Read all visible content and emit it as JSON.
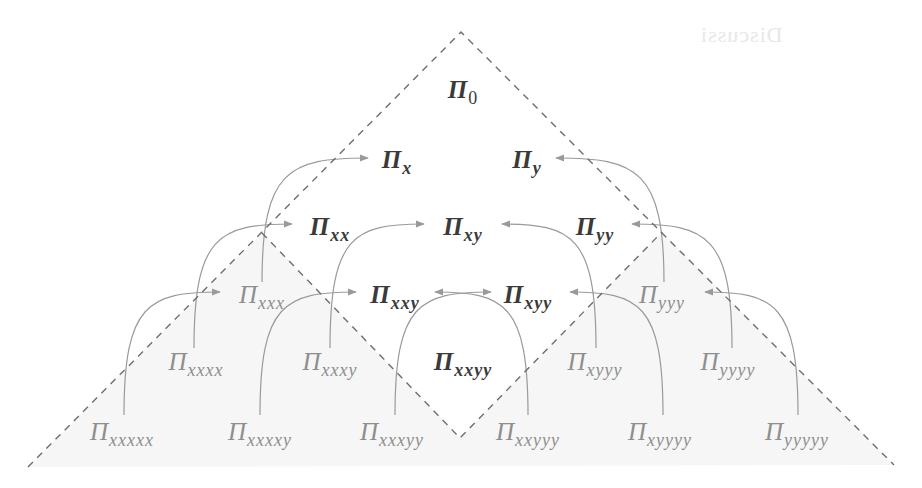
{
  "figure": {
    "ghost_text": "Discussi",
    "colors": {
      "dashed_line": "#6e6e6e",
      "arrow": "#9a9a9a",
      "dark_label": "#3a3a3a",
      "light_label": "#8e8e8e",
      "shade": "#f6f6f6"
    },
    "outer_triangle": {
      "apex": [
        461,
        32
      ],
      "left": [
        28,
        467
      ],
      "right": [
        894,
        465
      ]
    },
    "inner_diamond": {
      "top": [
        461,
        32
      ],
      "left": [
        262,
        233
      ],
      "bottom": [
        460,
        438
      ],
      "right": [
        662,
        232
      ]
    },
    "nodes": [
      {
        "id": "0",
        "symbol": "Π",
        "sub": "0",
        "x": 463,
        "y": 98,
        "style": "dark"
      },
      {
        "id": "x",
        "symbol": "Π",
        "sub": "x",
        "x": 397,
        "y": 168,
        "style": "dark"
      },
      {
        "id": "y",
        "symbol": "Π",
        "sub": "y",
        "x": 527,
        "y": 168,
        "style": "dark"
      },
      {
        "id": "xx",
        "symbol": "Π",
        "sub": "xx",
        "x": 330,
        "y": 235,
        "style": "dark"
      },
      {
        "id": "xy",
        "symbol": "Π",
        "sub": "xy",
        "x": 463,
        "y": 235,
        "style": "dark"
      },
      {
        "id": "yy",
        "symbol": "Π",
        "sub": "yy",
        "x": 595,
        "y": 235,
        "style": "dark"
      },
      {
        "id": "xxx",
        "symbol": "Π",
        "sub": "xxx",
        "x": 262,
        "y": 303,
        "style": "light"
      },
      {
        "id": "xxy",
        "symbol": "Π",
        "sub": "xxy",
        "x": 395,
        "y": 303,
        "style": "dark"
      },
      {
        "id": "xyy",
        "symbol": "Π",
        "sub": "xyy",
        "x": 528,
        "y": 303,
        "style": "dark"
      },
      {
        "id": "yyy",
        "symbol": "Π",
        "sub": "yyy",
        "x": 662,
        "y": 303,
        "style": "light"
      },
      {
        "id": "xxxx",
        "symbol": "Π",
        "sub": "xxxx",
        "x": 196,
        "y": 370,
        "style": "light"
      },
      {
        "id": "xxxy",
        "symbol": "Π",
        "sub": "xxxy",
        "x": 330,
        "y": 370,
        "style": "light"
      },
      {
        "id": "xxyy",
        "symbol": "Π",
        "sub": "xxyy",
        "x": 463,
        "y": 370,
        "style": "dark"
      },
      {
        "id": "xyyy",
        "symbol": "Π",
        "sub": "xyyy",
        "x": 595,
        "y": 370,
        "style": "light"
      },
      {
        "id": "yyyy",
        "symbol": "Π",
        "sub": "yyyy",
        "x": 728,
        "y": 370,
        "style": "light"
      },
      {
        "id": "xxxxx",
        "symbol": "Π",
        "sub": "xxxxx",
        "x": 122,
        "y": 440,
        "style": "light"
      },
      {
        "id": "xxxxy",
        "symbol": "Π",
        "sub": "xxxxy",
        "x": 260,
        "y": 440,
        "style": "light"
      },
      {
        "id": "xxxyy",
        "symbol": "Π",
        "sub": "xxxyy",
        "x": 392,
        "y": 440,
        "style": "light"
      },
      {
        "id": "xxyyy",
        "symbol": "Π",
        "sub": "xxyyy",
        "x": 528,
        "y": 440,
        "style": "light"
      },
      {
        "id": "xyyyy",
        "symbol": "Π",
        "sub": "xyyyy",
        "x": 660,
        "y": 440,
        "style": "light"
      },
      {
        "id": "yyyyy",
        "symbol": "Π",
        "sub": "yyyyy",
        "x": 797,
        "y": 440,
        "style": "light"
      }
    ],
    "arrows": [
      {
        "from": "xxx",
        "to": "x",
        "start": [
          262,
          282
        ],
        "end": [
          368,
          158
        ],
        "dir": "right"
      },
      {
        "from": "xxxx",
        "to": "xx",
        "start": [
          194,
          348
        ],
        "end": [
          292,
          224
        ],
        "dir": "right"
      },
      {
        "from": "xxxy",
        "to": "xy",
        "start": [
          330,
          348
        ],
        "end": [
          424,
          224
        ],
        "dir": "right"
      },
      {
        "from": "xxxxx",
        "to": "xxx",
        "start": [
          124,
          415
        ],
        "end": [
          220,
          292
        ],
        "dir": "right"
      },
      {
        "from": "xxxxy",
        "to": "xxy",
        "start": [
          260,
          415
        ],
        "end": [
          356,
          292
        ],
        "dir": "right"
      },
      {
        "from": "xxxyy",
        "to": "xyy",
        "start": [
          395,
          415
        ],
        "end": [
          491,
          292
        ],
        "dir": "right"
      },
      {
        "from": "yyy",
        "to": "y",
        "start": [
          664,
          282
        ],
        "end": [
          556,
          158
        ],
        "dir": "left"
      },
      {
        "from": "yyyy",
        "to": "yy",
        "start": [
          732,
          348
        ],
        "end": [
          632,
          224
        ],
        "dir": "left"
      },
      {
        "from": "xyyy",
        "to": "xy",
        "start": [
          596,
          348
        ],
        "end": [
          502,
          224
        ],
        "dir": "left"
      },
      {
        "from": "yyyyy",
        "to": "yyy",
        "start": [
          798,
          415
        ],
        "end": [
          705,
          292
        ],
        "dir": "left"
      },
      {
        "from": "xyyyy",
        "to": "xyy",
        "start": [
          663,
          415
        ],
        "end": [
          570,
          292
        ],
        "dir": "left"
      },
      {
        "from": "xxyyy",
        "to": "xxy",
        "start": [
          528,
          415
        ],
        "end": [
          435,
          292
        ],
        "dir": "left"
      }
    ]
  }
}
